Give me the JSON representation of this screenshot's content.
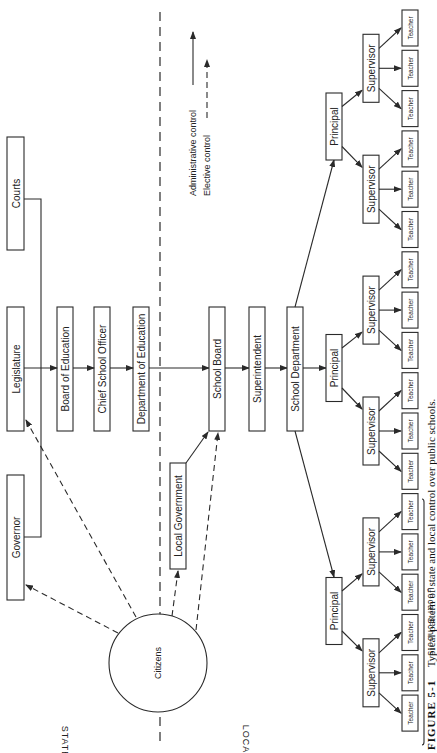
{
  "diagram": {
    "regions": {
      "state": "STATE",
      "local": "LOCAL",
      "local_schools": "Local Schools"
    },
    "legend": {
      "administrative": "Administrative control",
      "elective": "Elective control"
    },
    "state_nodes": {
      "courts": "Courts",
      "legislature": "Legislature",
      "governor": "Governor",
      "board_of_education": "Board of Education",
      "chief_school_officer": "Chief School Officer",
      "department_of_education": "Department of Education"
    },
    "local_nodes": {
      "local_government": "Local Government",
      "school_board": "School Board",
      "superintendent": "Superintendent",
      "school_department": "School Department",
      "citizens": "Citizens"
    },
    "school_nodes": {
      "principal": "Principal",
      "supervisor": "Supervisor",
      "teacher": "Teacher",
      "principal_count": 3,
      "supervisors_per_principal": 2,
      "teachers_per_supervisor": 3
    },
    "caption": {
      "label": "FIGURE 5-1",
      "text": "Typical pattern of state and local control over public schools."
    }
  }
}
